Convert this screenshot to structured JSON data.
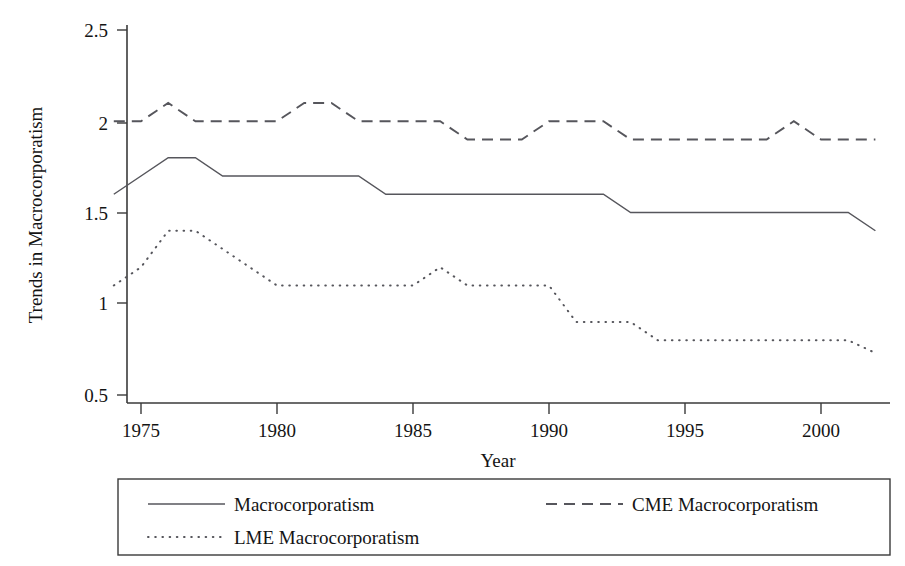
{
  "chart_data": {
    "type": "line",
    "title": "",
    "xlabel": "Year",
    "ylabel": "Trends in Macrocorporatism",
    "xlim": [
      1973.5,
      2002.5
    ],
    "ylim": [
      0.42,
      2.62
    ],
    "grid": false,
    "legend_position": "bottom",
    "x": [
      1974,
      1975,
      1976,
      1977,
      1978,
      1979,
      1980,
      1981,
      1982,
      1983,
      1984,
      1985,
      1986,
      1987,
      1988,
      1989,
      1990,
      1991,
      1992,
      1993,
      1994,
      1995,
      1996,
      1997,
      1998,
      1999,
      2000,
      2001,
      2002
    ],
    "xticks": [
      1975,
      1980,
      1985,
      1990,
      1995,
      2000
    ],
    "xtick_labels": [
      "1975",
      "1980",
      "1985",
      "1990",
      "1995",
      "2000"
    ],
    "yticks": [
      0.5,
      1,
      1.5,
      2,
      2.5
    ],
    "ytick_labels": [
      "0.5",
      "1",
      "1.5",
      "2",
      "2.5"
    ],
    "series": [
      {
        "name": "Macrocorporatism",
        "style": "solid",
        "values": [
          1.6,
          1.7,
          1.8,
          1.8,
          1.7,
          1.7,
          1.7,
          1.7,
          1.7,
          1.7,
          1.6,
          1.6,
          1.6,
          1.6,
          1.6,
          1.6,
          1.6,
          1.6,
          1.6,
          1.5,
          1.5,
          1.5,
          1.5,
          1.5,
          1.5,
          1.5,
          1.5,
          1.5,
          1.4
        ]
      },
      {
        "name": "CME Macrocorporatism",
        "style": "dashed",
        "values": [
          2.0,
          2.0,
          2.1,
          2.0,
          2.0,
          2.0,
          2.0,
          2.1,
          2.1,
          2.0,
          2.0,
          2.0,
          2.0,
          1.9,
          1.9,
          1.9,
          2.0,
          2.0,
          2.0,
          1.9,
          1.9,
          1.9,
          1.9,
          1.9,
          1.9,
          2.0,
          1.9,
          1.9,
          1.9
        ]
      },
      {
        "name": "LME Macrocorporatism",
        "style": "dotted",
        "values": [
          1.1,
          1.2,
          1.4,
          1.4,
          1.3,
          1.2,
          1.1,
          1.1,
          1.1,
          1.1,
          1.1,
          1.1,
          1.2,
          1.1,
          1.1,
          1.1,
          1.1,
          0.9,
          0.9,
          0.9,
          0.8,
          0.8,
          0.8,
          0.8,
          0.8,
          0.8,
          0.8,
          0.8,
          0.73
        ]
      }
    ]
  },
  "legend": {
    "entries": [
      {
        "label": "Macrocorporatism",
        "style": "solid"
      },
      {
        "label": "CME Macrocorporatism",
        "style": "dashed"
      },
      {
        "label": "LME Macrocorporatism",
        "style": "dotted"
      }
    ]
  }
}
